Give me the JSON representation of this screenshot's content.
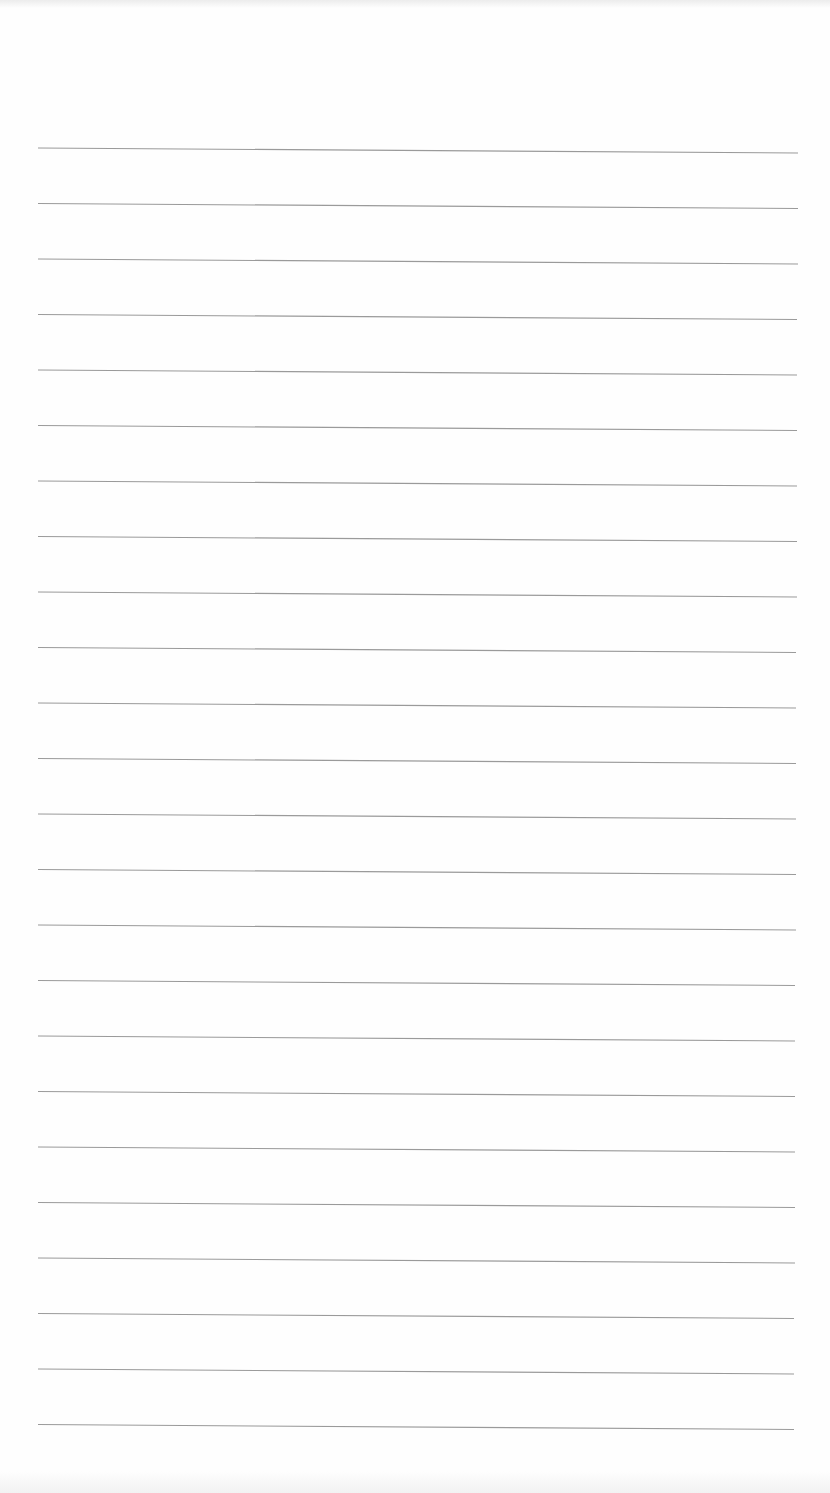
{
  "document": {
    "type": "blank lined paper",
    "line_count": 24,
    "line_color": "#9a9a9a",
    "paper_color": "#fefefe",
    "first_line_y": 148,
    "line_spacing": 55.5,
    "line_left_x": 38,
    "line_right_x": 798,
    "line_slope_px": 5
  }
}
